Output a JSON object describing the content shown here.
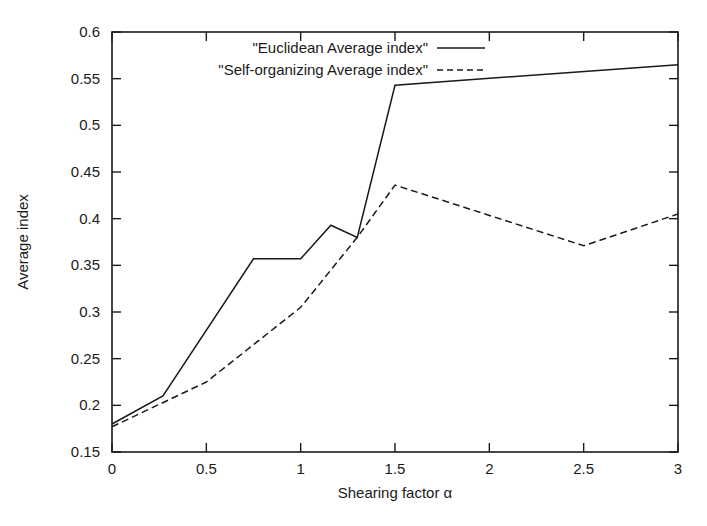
{
  "chart_data": {
    "type": "line",
    "title": "",
    "xlabel": "Shearing factor α",
    "ylabel": "Average index",
    "xlim": [
      0,
      3
    ],
    "ylim": [
      0.15,
      0.6
    ],
    "grid": false,
    "legend_position": "top-center",
    "xticks": [
      "0",
      "0.5",
      "1",
      "1.5",
      "2",
      "2.5",
      "3"
    ],
    "xtick_values": [
      0,
      0.5,
      1,
      1.5,
      2,
      2.5,
      3
    ],
    "yticks": [
      "0.15",
      "0.2",
      "0.25",
      "0.3",
      "0.35",
      "0.4",
      "0.45",
      "0.5",
      "0.55",
      "0.6"
    ],
    "ytick_values": [
      0.15,
      0.2,
      0.25,
      0.3,
      0.35,
      0.4,
      0.45,
      0.5,
      0.55,
      0.6
    ],
    "series": [
      {
        "name": "\"Euclidean Average index\"",
        "style": "solid",
        "color": "#1a1a1a",
        "x": [
          0,
          0.27,
          0.75,
          1.0,
          1.16,
          1.3,
          1.5,
          3.0
        ],
        "values": [
          0.18,
          0.21,
          0.357,
          0.357,
          0.393,
          0.38,
          0.543,
          0.565
        ]
      },
      {
        "name": "\"Self-organizing Average index\"",
        "style": "dashed",
        "color": "#1a1a1a",
        "x": [
          0,
          0.5,
          1.0,
          1.3,
          1.5,
          2.5,
          3.0
        ],
        "values": [
          0.177,
          0.225,
          0.305,
          0.38,
          0.436,
          0.371,
          0.405
        ]
      }
    ]
  },
  "legend": {
    "entries": [
      {
        "label": "\"Euclidean Average index\"",
        "style": "solid"
      },
      {
        "label": "\"Self-organizing Average index\"",
        "style": "dashed"
      }
    ]
  },
  "axes": {
    "x_title": "Shearing factor α",
    "y_title": "Average index"
  }
}
